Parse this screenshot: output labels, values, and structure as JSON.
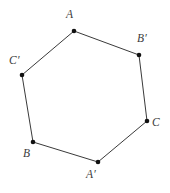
{
  "figure": {
    "type": "geometry-diagram",
    "shape_name": "hexagon",
    "background_color": "#ffffff",
    "width": 170,
    "height": 193
  },
  "style": {
    "edge_color": "#3a3a3a",
    "edge_width": 1,
    "vertex_dot_color": "#111111",
    "vertex_dot_radius": 2.3,
    "label_color": "#3b3b3b",
    "label_font_size": 11.5,
    "label_italic": true
  },
  "vertices": [
    {
      "label": "A",
      "x": 74,
      "y": 31,
      "label_x": 66,
      "label_y": 9
    },
    {
      "label": "B′",
      "x": 139,
      "y": 55,
      "label_x": 137,
      "label_y": 33
    },
    {
      "label": "C",
      "x": 147,
      "y": 121,
      "label_x": 152,
      "label_y": 117
    },
    {
      "label": "A′",
      "x": 98,
      "y": 162,
      "label_x": 86,
      "label_y": 169
    },
    {
      "label": "B",
      "x": 33,
      "y": 142,
      "label_x": 23,
      "label_y": 148
    },
    {
      "label": "C′",
      "x": 22,
      "y": 75,
      "label_x": 9,
      "label_y": 55
    }
  ],
  "edges": [
    {
      "from": "A",
      "to": "B′"
    },
    {
      "from": "B′",
      "to": "C"
    },
    {
      "from": "C",
      "to": "A′"
    },
    {
      "from": "A′",
      "to": "B"
    },
    {
      "from": "B",
      "to": "C′"
    },
    {
      "from": "C′",
      "to": "A"
    }
  ]
}
